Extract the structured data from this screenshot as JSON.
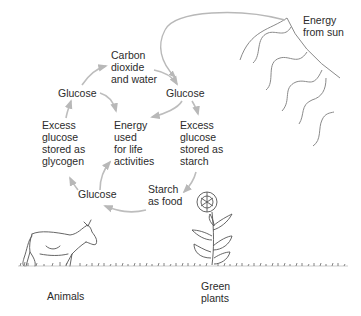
{
  "diagram": {
    "sun_label": "Energy\nfrom sun",
    "nodes": {
      "co2_water": "Carbon\ndioxide\nand water",
      "glucose_left": "Glucose",
      "glucose_right": "Glucose",
      "glucose_bottom": "Glucose",
      "energy_used": "Energy\nused\nfor life\nactivities",
      "glycogen": "Excess\nglucose\nstored as\nglycogen",
      "starch_stored": "Excess\nglucose\nstored as\nstarch",
      "starch_food": "Starch\nas food"
    },
    "organisms": {
      "animals": "Animals",
      "plants": "Green\nplants"
    },
    "edges": [
      {
        "from": "glucose_left",
        "to": "co2_water"
      },
      {
        "from": "co2_water",
        "to": "glucose_right"
      },
      {
        "from": "sun",
        "to": "glucose_right"
      },
      {
        "from": "glucose_right",
        "to": "energy_used"
      },
      {
        "from": "glucose_right",
        "to": "starch_stored"
      },
      {
        "from": "glucose_left",
        "to": "energy_used"
      },
      {
        "from": "starch_stored",
        "to": "starch_food"
      },
      {
        "from": "starch_food",
        "to": "glucose_bottom"
      },
      {
        "from": "glucose_bottom",
        "to": "energy_used"
      },
      {
        "from": "glucose_bottom",
        "to": "glycogen"
      },
      {
        "from": "glycogen",
        "to": "glucose_left"
      }
    ],
    "colors": {
      "arrow": "#b5b5b5",
      "line": "#8a8a8a",
      "text": "#2b2b2b"
    }
  }
}
